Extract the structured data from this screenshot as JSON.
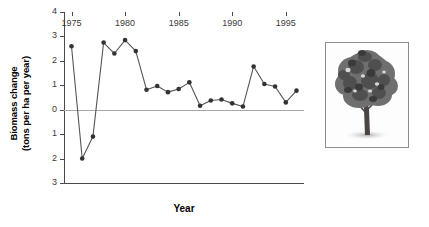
{
  "chart_data": {
    "type": "line",
    "title": "",
    "xlabel": "Year",
    "ylabel_line1": "Biomass change",
    "ylabel_line2": "(tons per ha per year)",
    "xlim": [
      1974.3,
      1996.7
    ],
    "ylim": [
      -3,
      4
    ],
    "grid": false,
    "legend": null,
    "zero_reference_line": true,
    "marker": "filled-circle",
    "line_color": "#555555",
    "marker_color": "#333333",
    "zero_line_color": "#a8a8a8",
    "axis_color": "#4a4a4a",
    "x": [
      1975,
      1976,
      1977,
      1978,
      1979,
      1980,
      1981,
      1982,
      1983,
      1984,
      1985,
      1986,
      1987,
      1988,
      1989,
      1990,
      1991,
      1992,
      1993,
      1994,
      1995,
      1996
    ],
    "values": [
      2.6,
      -2.0,
      -1.1,
      2.75,
      2.3,
      2.85,
      2.4,
      0.82,
      0.97,
      0.72,
      0.85,
      1.12,
      0.16,
      0.38,
      0.42,
      0.26,
      0.13,
      1.77,
      1.05,
      0.95,
      0.3,
      0.78
    ],
    "xticks": [
      1975,
      1980,
      1985,
      1990,
      1995
    ],
    "xtick_labels": [
      "1975",
      "1980",
      "1985",
      "1990",
      "1995"
    ],
    "yticks": [
      4,
      3,
      2,
      1,
      0,
      -1,
      -2,
      -3
    ],
    "ytick_labels": [
      "4",
      "3",
      "2",
      "1",
      "0",
      "1",
      "2",
      "3"
    ]
  },
  "photo": {
    "caption": "",
    "alt_name": "tree-photograph"
  }
}
